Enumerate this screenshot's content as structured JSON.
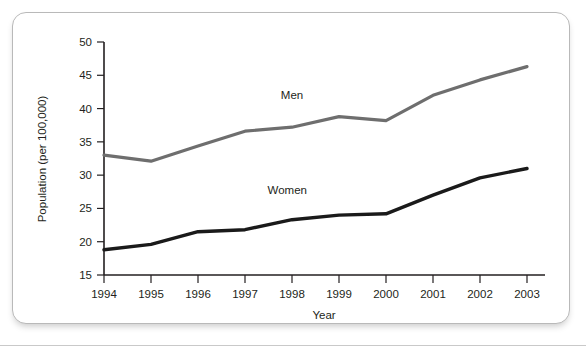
{
  "chart_data": {
    "type": "line",
    "title": "",
    "xlabel": "Year",
    "ylabel": "Population (per 100,000)",
    "categories": [
      "1994",
      "1995",
      "1996",
      "1997",
      "1998",
      "1999",
      "2000",
      "2001",
      "2002",
      "2003"
    ],
    "x": [
      1994,
      1995,
      1996,
      1997,
      1998,
      1999,
      2000,
      2001,
      2002,
      2003
    ],
    "xlim": [
      1994,
      2003
    ],
    "ylim": [
      15,
      50
    ],
    "yticks": [
      15,
      20,
      25,
      30,
      35,
      40,
      45,
      50
    ],
    "xticks": [
      "1994",
      "1995",
      "1996",
      "1997",
      "1998",
      "1999",
      "2000",
      "2001",
      "2002",
      "2003"
    ],
    "grid": false,
    "legend_position": "inline-annotations",
    "series": [
      {
        "name": "Men",
        "color": "#6e6e6e",
        "stroke_width": 3.2,
        "label_x": 1998,
        "label_y": 41.5,
        "values": [
          33.0,
          32.1,
          34.4,
          36.6,
          37.2,
          38.8,
          38.2,
          42.0,
          44.3,
          46.3
        ]
      },
      {
        "name": "Women",
        "color": "#1a1a1a",
        "stroke_width": 3.4,
        "label_x": 1997.9,
        "label_y": 27.2,
        "values": [
          18.8,
          19.6,
          21.5,
          21.8,
          23.3,
          24.0,
          24.2,
          27.0,
          29.6,
          31.0
        ]
      }
    ]
  }
}
